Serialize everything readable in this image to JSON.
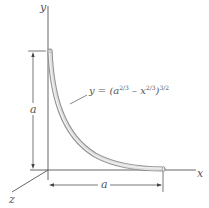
{
  "diagram": {
    "axes": {
      "x_label": "x",
      "y_label": "y",
      "z_label": "z"
    },
    "curve": {
      "equation_prefix": "y = (a",
      "exp1": "2/3",
      "minus": " – x",
      "exp2": "2/3",
      "close": ")",
      "exp3": "3/2",
      "rod_color": "#c8c8c8"
    },
    "dimensions": {
      "vertical": "a",
      "horizontal": "a"
    },
    "colors": {
      "line": "#555555",
      "rod_fill": "#d0d0d0",
      "rod_edge": "#9a9a9a"
    }
  }
}
